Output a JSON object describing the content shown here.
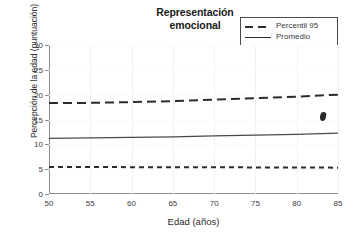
{
  "chart_data": {
    "type": "line",
    "title": "Representación emocional",
    "title_lines": [
      "Representación",
      "emocional"
    ],
    "xlabel": "Edad (años)",
    "ylabel": "Percepción de la edad (puntuación)",
    "xlim": [
      50,
      85
    ],
    "ylim": [
      0,
      30
    ],
    "xticks": [
      50,
      55,
      60,
      65,
      70,
      75,
      80,
      85
    ],
    "yticks": [
      0,
      5,
      10,
      15,
      20,
      25,
      30
    ],
    "grid": "faint",
    "legend_position": "top-right",
    "x": [
      50,
      55,
      60,
      65,
      70,
      75,
      80,
      85
    ],
    "series": [
      {
        "name": "Percentil 95",
        "style": "dashed-long",
        "color": "#2b2b2b",
        "values": [
          18.3,
          18.35,
          18.5,
          18.7,
          19.0,
          19.3,
          19.6,
          20.0
        ]
      },
      {
        "name": "Promedio",
        "style": "solid",
        "color": "#4a4a4a",
        "values": [
          11.2,
          11.3,
          11.4,
          11.5,
          11.7,
          11.85,
          12.0,
          12.25
        ]
      },
      {
        "name": "Percentil 5",
        "style": "dashed-short",
        "color": "#2b2b2b",
        "values": [
          5.45,
          5.45,
          5.4,
          5.4,
          5.4,
          5.35,
          5.35,
          5.3
        ]
      }
    ]
  },
  "legend": {
    "items": [
      {
        "label": "Percentil 95",
        "swatch": "dashed-long-line-icon"
      },
      {
        "label": "Promedio",
        "swatch": "solid-line-icon"
      },
      {
        "label": "Percentil 5",
        "swatch": "dashed-short-line-icon"
      }
    ]
  },
  "annotations": {
    "stray_mark": "ink-smudge-marker"
  }
}
